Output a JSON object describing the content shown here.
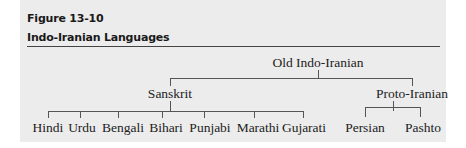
{
  "figure": {
    "number": "Figure 13-10",
    "title": "Indo-Iranian Languages"
  },
  "tree": {
    "root": {
      "label": "Old Indo-Iranian"
    },
    "branches": [
      {
        "label": "Sanskrit",
        "children": [
          "Hindi",
          "Urdu",
          "Bengali",
          "Bihari",
          "Punjabi",
          "Marathi",
          "Gujarati"
        ]
      },
      {
        "label": "Proto-Iranian",
        "children": [
          "Persian",
          "Pashto"
        ]
      }
    ]
  },
  "colors": {
    "panel_background": "#ececec",
    "page_background": "#ffffff",
    "text": "#222222",
    "lines": "#555555"
  }
}
